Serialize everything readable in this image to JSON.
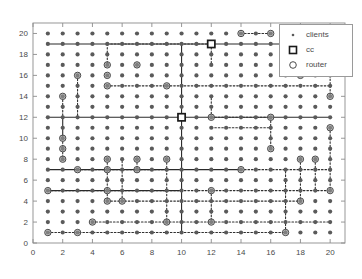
{
  "figure": {
    "width": 362,
    "height": 279,
    "background": "#ffffff",
    "axes_color": "#8c8c8c",
    "tick_label_color": "#4a4a4a"
  },
  "legend": {
    "position": "top-right",
    "items": [
      {
        "label": "clients",
        "marker": "small-dot-marker",
        "color": "#5a5a5a"
      },
      {
        "label": "cc",
        "marker": "square-marker",
        "color": "#2a2a2a"
      },
      {
        "label": "router",
        "marker": "circle-marker",
        "color": "#4a4a4a"
      }
    ]
  },
  "chart_data": {
    "type": "scatter",
    "title": "",
    "xlabel": "",
    "ylabel": "",
    "xlim": [
      0,
      21
    ],
    "ylim": [
      0,
      21
    ],
    "xticks": [
      0,
      2,
      4,
      6,
      8,
      10,
      12,
      14,
      16,
      18,
      20
    ],
    "yticks": [
      0,
      2,
      4,
      6,
      8,
      10,
      12,
      14,
      16,
      18,
      20
    ],
    "xticklabels": [
      "0",
      "2",
      "4",
      "6",
      "8",
      "10",
      "12",
      "14",
      "16",
      "18",
      "20"
    ],
    "yticklabels": [
      "0",
      "2",
      "4",
      "6",
      "8",
      "10",
      "12",
      "14",
      "16",
      "18",
      "20"
    ],
    "grid": false,
    "series": [
      {
        "name": "clients",
        "marker": "small-dot-marker",
        "color": "#5a5a5a",
        "size": 2.1,
        "description": "uniform 20x20 lattice of client nodes at every integer coordinate from 1 to 20",
        "x_range": [
          1,
          20
        ],
        "y_range": [
          1,
          20
        ]
      },
      {
        "name": "cc",
        "marker": "square-marker",
        "color": "#1a1a1a",
        "points": [
          [
            12,
            19
          ],
          [
            10,
            12
          ]
        ]
      },
      {
        "name": "router",
        "marker": "circle-marker",
        "color": "#4a4a4a",
        "points": [
          [
            2,
            14
          ],
          [
            3,
            16
          ],
          [
            5,
            17
          ],
          [
            7,
            17
          ],
          [
            5,
            16
          ],
          [
            5,
            15
          ],
          [
            9,
            15
          ],
          [
            14,
            20
          ],
          [
            16,
            20
          ],
          [
            20,
            19
          ],
          [
            18,
            18
          ],
          [
            18,
            17
          ],
          [
            18,
            16
          ],
          [
            20,
            14
          ],
          [
            12,
            12
          ],
          [
            16,
            12
          ],
          [
            20,
            11
          ],
          [
            2,
            10
          ],
          [
            2,
            9
          ],
          [
            2,
            8
          ],
          [
            5,
            8
          ],
          [
            7,
            8
          ],
          [
            9,
            8
          ],
          [
            16,
            9
          ],
          [
            18,
            8
          ],
          [
            19,
            8
          ],
          [
            3,
            7
          ],
          [
            5,
            7
          ],
          [
            7,
            7
          ],
          [
            14,
            7
          ],
          [
            1,
            5
          ],
          [
            5,
            5
          ],
          [
            12,
            5
          ],
          [
            20,
            5
          ],
          [
            5,
            4
          ],
          [
            6,
            4
          ],
          [
            18,
            4
          ],
          [
            4,
            2
          ],
          [
            9,
            2
          ],
          [
            12,
            2
          ],
          [
            1,
            1
          ],
          [
            3,
            1
          ],
          [
            17,
            1
          ]
        ]
      }
    ],
    "links": {
      "description": "dotted and solid connection lines forming a hierarchical backbone between routers and control centers",
      "solid_segments": [
        {
          "from": [
            1,
            12
          ],
          "to": [
            20,
            12
          ]
        },
        {
          "from": [
            1,
            19
          ],
          "to": [
            20,
            19
          ]
        },
        {
          "from": [
            1,
            7
          ],
          "to": [
            14,
            7
          ]
        },
        {
          "from": [
            1,
            5
          ],
          "to": [
            10,
            5
          ]
        },
        {
          "from": [
            10,
            1
          ],
          "to": [
            10,
            12
          ]
        },
        {
          "from": [
            2,
            10
          ],
          "to": [
            2,
            12
          ]
        },
        {
          "from": [
            10,
            12
          ],
          "to": [
            10,
            19
          ]
        }
      ],
      "dotted_segments": [
        {
          "from": [
            5,
            19
          ],
          "to": [
            5,
            17
          ]
        },
        {
          "from": [
            5,
            19
          ],
          "to": [
            12,
            19
          ]
        },
        {
          "from": [
            12,
            19
          ],
          "to": [
            12,
            17
          ]
        },
        {
          "from": [
            14,
            20
          ],
          "to": [
            16,
            20
          ]
        },
        {
          "from": [
            5,
            15
          ],
          "to": [
            9,
            15
          ]
        },
        {
          "from": [
            9,
            15
          ],
          "to": [
            20,
            15
          ]
        },
        {
          "from": [
            2,
            14
          ],
          "to": [
            2,
            12
          ]
        },
        {
          "from": [
            3,
            16
          ],
          "to": [
            3,
            12
          ]
        },
        {
          "from": [
            20,
            19
          ],
          "to": [
            20,
            14
          ]
        },
        {
          "from": [
            18,
            18
          ],
          "to": [
            18,
            16
          ]
        },
        {
          "from": [
            12,
            12
          ],
          "to": [
            12,
            14
          ]
        },
        {
          "from": [
            12,
            12
          ],
          "to": [
            16,
            12
          ]
        },
        {
          "from": [
            12,
            11
          ],
          "to": [
            16,
            11
          ]
        },
        {
          "from": [
            16,
            12
          ],
          "to": [
            16,
            9
          ]
        },
        {
          "from": [
            2,
            10
          ],
          "to": [
            2,
            8
          ]
        },
        {
          "from": [
            3,
            7
          ],
          "to": [
            9,
            7
          ]
        },
        {
          "from": [
            5,
            8
          ],
          "to": [
            5,
            4
          ]
        },
        {
          "from": [
            7,
            8
          ],
          "to": [
            7,
            7
          ]
        },
        {
          "from": [
            9,
            8
          ],
          "to": [
            9,
            2
          ]
        },
        {
          "from": [
            1,
            5
          ],
          "to": [
            20,
            5
          ]
        },
        {
          "from": [
            5,
            4
          ],
          "to": [
            18,
            4
          ]
        },
        {
          "from": [
            4,
            2
          ],
          "to": [
            20,
            2
          ]
        },
        {
          "from": [
            1,
            1
          ],
          "to": [
            17,
            1
          ]
        },
        {
          "from": [
            17,
            1
          ],
          "to": [
            17,
            7
          ]
        },
        {
          "from": [
            18,
            8
          ],
          "to": [
            18,
            4
          ]
        },
        {
          "from": [
            19,
            8
          ],
          "to": [
            19,
            5
          ]
        },
        {
          "from": [
            14,
            7
          ],
          "to": [
            20,
            7
          ]
        },
        {
          "from": [
            12,
            5
          ],
          "to": [
            12,
            2
          ]
        },
        {
          "from": [
            6,
            4
          ],
          "to": [
            6,
            8
          ]
        },
        {
          "from": [
            20,
            11
          ],
          "to": [
            20,
            5
          ]
        }
      ]
    }
  }
}
